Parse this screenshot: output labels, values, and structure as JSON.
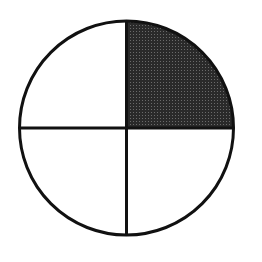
{
  "figure": {
    "type": "fraction-circle",
    "parts_total": 4,
    "parts_shaded": 1,
    "shaded_parts": [
      "top-right"
    ],
    "fraction": "1/4"
  },
  "geometry": {
    "cx": 126.5,
    "cy": 128,
    "r": 107
  },
  "colors": {
    "background": "#ffffff",
    "outline": "#111111",
    "shade": "#333333",
    "unshaded": "#ffffff"
  }
}
